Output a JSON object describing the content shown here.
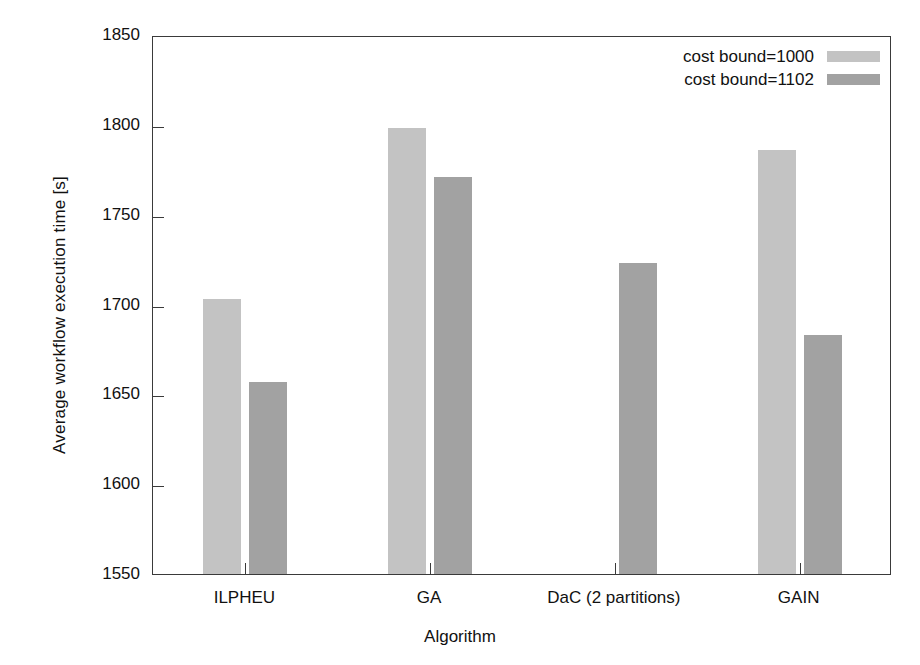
{
  "chart_data": {
    "type": "bar",
    "title": "",
    "xlabel": "Algorithm",
    "ylabel": "Average workflow execution time [s]",
    "categories": [
      "ILPHEU",
      "GA",
      "DaC (2 partitions)",
      "GAIN"
    ],
    "series": [
      {
        "name": "cost bound=1000",
        "color": "#c3c3c3",
        "values": [
          1703,
          1798,
          null,
          1786
        ]
      },
      {
        "name": "cost bound=1102",
        "color": "#a2a2a2",
        "values": [
          1657,
          1771,
          1723,
          1683
        ]
      }
    ],
    "ylim": [
      1550,
      1850
    ],
    "yticks": [
      1550,
      1600,
      1650,
      1700,
      1750,
      1800,
      1850
    ],
    "ytick_labels": [
      "1550",
      "1600",
      "1650",
      "1700",
      "1750",
      "1800",
      "1850"
    ],
    "grid": false,
    "legend_position": "top-right",
    "legend_entries": [
      "cost bound=1000",
      "cost bound=1102"
    ],
    "frame_color": "#3a3a3a",
    "background": "#ffffff"
  }
}
